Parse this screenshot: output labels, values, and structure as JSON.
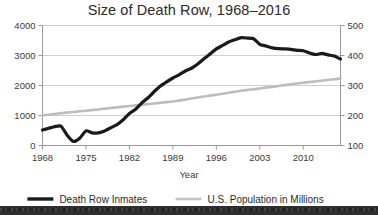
{
  "chart_data": {
    "type": "line",
    "title": "Size of Death Row, 1968–2016",
    "xlabel": "Year",
    "ylabel": "",
    "xlim": [
      1968,
      2016
    ],
    "ylim": [
      0,
      4000
    ],
    "y2lim": [
      100,
      500
    ],
    "grid": true,
    "legend_position": "bottom",
    "x_ticks": [
      1968,
      1975,
      1982,
      1989,
      1996,
      2003,
      2010
    ],
    "x_tick_labels": [
      "1968",
      "1975",
      "1982",
      "1989",
      "1996",
      "2003",
      "2010"
    ],
    "y_ticks": [
      0,
      1000,
      2000,
      3000,
      4000
    ],
    "y_tick_labels": [
      "0",
      "1000",
      "2000",
      "3000",
      "4000"
    ],
    "y2_ticks": [
      100,
      200,
      300,
      400,
      500
    ],
    "y2_tick_labels": [
      "100",
      "200",
      "300",
      "400",
      "500"
    ],
    "series": [
      {
        "name": "Death Row Inmates",
        "axis": "left",
        "color": "#1a1a1a",
        "width": 3.2,
        "x": [
          1968,
          1969,
          1970,
          1971,
          1972,
          1973,
          1974,
          1975,
          1976,
          1977,
          1978,
          1979,
          1980,
          1981,
          1982,
          1983,
          1984,
          1985,
          1986,
          1987,
          1988,
          1989,
          1990,
          1991,
          1992,
          1993,
          1994,
          1995,
          1996,
          1997,
          1998,
          1999,
          2000,
          2001,
          2002,
          2003,
          2004,
          2005,
          2006,
          2007,
          2008,
          2009,
          2010,
          2011,
          2012,
          2013,
          2014,
          2015,
          2016
        ],
        "values": [
          517,
          575,
          631,
          642,
          334,
          134,
          244,
          488,
          420,
          423,
          482,
          593,
          697,
          860,
          1066,
          1209,
          1420,
          1591,
          1800,
          1984,
          2124,
          2250,
          2356,
          2482,
          2575,
          2716,
          2890,
          3054,
          3219,
          3335,
          3452,
          3527,
          3593,
          3581,
          3557,
          3374,
          3315,
          3254,
          3228,
          3220,
          3207,
          3173,
          3158,
          3082,
          3033,
          3070,
          3019,
          2984,
          2881
        ]
      },
      {
        "name": "U.S. Population in Millions",
        "axis": "right",
        "color": "#bdbdbd",
        "width": 2.6,
        "x": [
          1968,
          1969,
          1970,
          1971,
          1972,
          1973,
          1974,
          1975,
          1976,
          1977,
          1978,
          1979,
          1980,
          1981,
          1982,
          1983,
          1984,
          1985,
          1986,
          1987,
          1988,
          1989,
          1990,
          1991,
          1992,
          1993,
          1994,
          1995,
          1996,
          1997,
          1998,
          1999,
          2000,
          2001,
          2002,
          2003,
          2004,
          2005,
          2006,
          2007,
          2008,
          2009,
          2010,
          2011,
          2012,
          2013,
          2014,
          2015,
          2016
        ],
        "values": [
          200.7,
          202.7,
          205.1,
          207.7,
          209.9,
          211.9,
          213.9,
          216.0,
          218.0,
          220.2,
          222.6,
          225.1,
          227.2,
          229.5,
          231.7,
          233.8,
          235.8,
          237.9,
          240.1,
          242.3,
          244.5,
          246.8,
          249.6,
          252.9,
          256.5,
          259.9,
          263.1,
          266.3,
          269.4,
          272.6,
          275.9,
          279.0,
          282.2,
          285.0,
          287.6,
          290.1,
          292.8,
          295.5,
          298.4,
          301.2,
          304.1,
          306.8,
          309.3,
          311.6,
          313.9,
          316.1,
          318.6,
          321.0,
          323.1
        ]
      }
    ],
    "legend": [
      {
        "label": "Death Row Inmates",
        "color": "#1a1a1a",
        "width": 3.4
      },
      {
        "label": "U.S. Population in Millions",
        "color": "#c4c4c4",
        "width": 2.6
      }
    ]
  },
  "colors": {
    "background": "#ffffff",
    "grid": "#cfcfcf",
    "axis": "#9a9a9a",
    "text": "#2b2b2b",
    "inmates_line": "#1a1a1a",
    "population_line": "#bdbdbd",
    "bottom_band": "#2e2e2e"
  }
}
